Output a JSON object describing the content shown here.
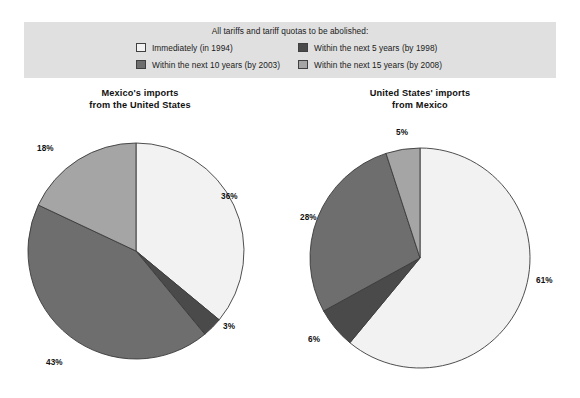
{
  "legend": {
    "title": "All tariffs and tariff quotas to be abolished:",
    "items": [
      {
        "label": "Immediately (in 1994)",
        "color": "#f2f2f2",
        "key": "immediately"
      },
      {
        "label": "Within the next 5 years (by 1998)",
        "color": "#4a4a4a",
        "key": "five_years"
      },
      {
        "label": "Within the next 10 years (by 2003)",
        "color": "#6e6e6e",
        "key": "ten_years"
      },
      {
        "label": "Within the next 15 years (by 2008)",
        "color": "#a5a5a5",
        "key": "fifteen_years"
      }
    ]
  },
  "charts": {
    "left": {
      "title_line1": "Mexico's imports",
      "title_line2": "from the United States",
      "labels": {
        "immediately": "36%",
        "five_years": "3%",
        "ten_years": "43%",
        "fifteen_years": "18%"
      }
    },
    "right": {
      "title_line1": "United States' imports",
      "title_line2": "from Mexico",
      "labels": {
        "immediately": "61%",
        "five_years": "6%",
        "ten_years": "28%",
        "fifteen_years": "5%"
      }
    }
  },
  "chart_data": [
    {
      "type": "pie",
      "title": "Mexico's imports from the United States",
      "categories": [
        "Immediately (in 1994)",
        "Within the next 5 years (by 1998)",
        "Within the next 10 years (by 2003)",
        "Within the next 15 years (by 2008)"
      ],
      "values": [
        36,
        3,
        43,
        18
      ],
      "value_labels": [
        "36%",
        "3%",
        "43%",
        "18%"
      ],
      "colors": [
        "#f2f2f2",
        "#4a4a4a",
        "#6e6e6e",
        "#a5a5a5"
      ],
      "units": "percent",
      "start_angle_deg": 0,
      "direction": "clockwise",
      "legend_position": "top"
    },
    {
      "type": "pie",
      "title": "United States' imports from Mexico",
      "categories": [
        "Immediately (in 1994)",
        "Within the next 5 years (by 1998)",
        "Within the next 10 years (by 2003)",
        "Within the next 15 years (by 2008)"
      ],
      "values": [
        61,
        6,
        28,
        5
      ],
      "value_labels": [
        "61%",
        "6%",
        "28%",
        "5%"
      ],
      "colors": [
        "#f2f2f2",
        "#4a4a4a",
        "#6e6e6e",
        "#a5a5a5"
      ],
      "units": "percent",
      "start_angle_deg": 0,
      "direction": "clockwise",
      "legend_position": "top"
    }
  ]
}
